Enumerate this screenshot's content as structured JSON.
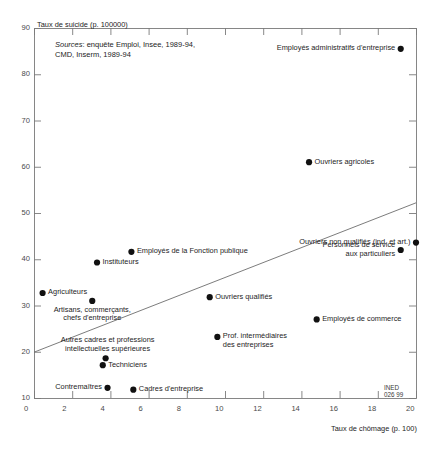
{
  "chart_data": {
    "type": "scatter",
    "title": "",
    "ylabel": "Taux de suicide (p. 100000)",
    "xlabel": "Taux de chômage (p. 100)",
    "xlim": [
      0,
      20
    ],
    "ylim": [
      10,
      90
    ],
    "xticks": [
      0,
      2,
      4,
      6,
      8,
      10,
      12,
      14,
      16,
      18,
      20
    ],
    "yticks": [
      10,
      20,
      30,
      40,
      50,
      60,
      70,
      80,
      90
    ],
    "grid": false,
    "legend": "none",
    "source_note": "Sources: enquête Emploi, Insee, 1989-94, CMD, Inserm, 1989-94",
    "source_note_italic": "Sources",
    "source_note_rest": ": enquête Emploi, Insee, 1989-94,",
    "source_note_line2": "CMD, Inserm, 1989-94",
    "credit": "INED",
    "credit_code": "026 99",
    "marker_color": "#111111",
    "axis_color": "#7a7a7a",
    "trendline": {
      "x0": 0,
      "y0": 19.9,
      "x1": 20,
      "y1": 52.2
    },
    "points": [
      {
        "label": "Employés administratifs d'entreprise",
        "x": 19.2,
        "y": 85.5,
        "label_pos": "left"
      },
      {
        "label": "Ouvriers agricoles",
        "x": 14.4,
        "y": 61.0,
        "label_pos": "right"
      },
      {
        "label": "Ouvriers non qualifiés (ind. et art.)",
        "x": 20.0,
        "y": 43.6,
        "label_pos": "left"
      },
      {
        "label": "Personnels de service\naux particuliers",
        "x": 19.2,
        "y": 42.0,
        "label_pos": "left"
      },
      {
        "label": "Employés de la Fonction publique",
        "x": 5.1,
        "y": 41.6,
        "label_pos": "right"
      },
      {
        "label": "Instituteurs",
        "x": 3.3,
        "y": 39.3,
        "label_pos": "right"
      },
      {
        "label": "Agriculteurs",
        "x": 0.45,
        "y": 32.7,
        "label_pos": "right"
      },
      {
        "label": "Ouvriers qualifiés",
        "x": 9.2,
        "y": 31.8,
        "label_pos": "right"
      },
      {
        "label": "Artisans, commerçants,\nchefs d'entreprise",
        "x": 3.05,
        "y": 31.0,
        "label_pos": "below"
      },
      {
        "label": "Employés de commerce",
        "x": 14.8,
        "y": 27.0,
        "label_pos": "right"
      },
      {
        "label": "Prof. intermédiaires\ndes entreprises",
        "x": 9.6,
        "y": 23.2,
        "label_pos": "right"
      },
      {
        "label": "Autres cadres et professions\nintellectuelles supérieures",
        "x": 3.75,
        "y": 18.6,
        "label_pos": "above"
      },
      {
        "label": "Techniciens",
        "x": 3.6,
        "y": 17.1,
        "label_pos": "right"
      },
      {
        "label": "Contremaîtres",
        "x": 3.85,
        "y": 12.2,
        "label_pos": "left"
      },
      {
        "label": "Cadres d'entreprise",
        "x": 5.2,
        "y": 11.8,
        "label_pos": "right"
      }
    ]
  }
}
